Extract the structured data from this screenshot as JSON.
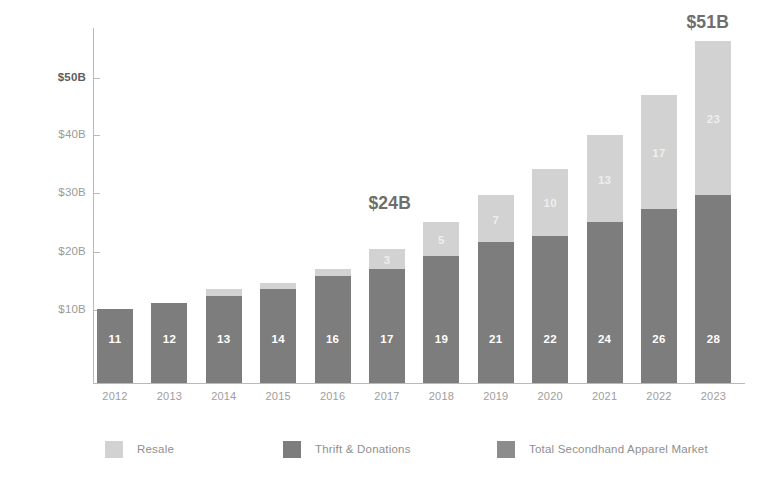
{
  "chart_data": {
    "type": "bar",
    "stacked": true,
    "title": "",
    "subtitle": "",
    "xlabel": "",
    "ylabel": "",
    "grid": false,
    "legend_position": "bottom",
    "categories": [
      "2012",
      "2013",
      "2014",
      "2015",
      "2016",
      "2017",
      "2018",
      "2019",
      "2020",
      "2021",
      "2022",
      "2023"
    ],
    "ylim": [
      0,
      53
    ],
    "yticks": [
      10,
      20,
      30,
      40,
      50
    ],
    "ytick_labels": [
      "$10B",
      "$20B",
      "$30B",
      "$40B",
      "$50B"
    ],
    "series": [
      {
        "name": "Thrift & Donations",
        "color": "#7d7d7d",
        "values": [
          11,
          12,
          13,
          14,
          16,
          17,
          19,
          21,
          22,
          24,
          26,
          28
        ],
        "labels": [
          "11",
          "12",
          "13",
          "14",
          "16",
          "17",
          "19",
          "21",
          "22",
          "24",
          "26",
          "28"
        ]
      },
      {
        "name": "Resale",
        "color": "#d2d2d2",
        "values": [
          0,
          0,
          1,
          1,
          1,
          3,
          5,
          7,
          10,
          13,
          17,
          23
        ],
        "labels": [
          "",
          "",
          "",
          "",
          "",
          "3",
          "5",
          "7",
          "10",
          "13",
          "17",
          "23"
        ]
      }
    ],
    "totals": [
      11,
      12,
      14,
      15,
      17,
      20,
      24,
      28,
      32,
      37,
      43,
      51
    ],
    "annotations": [
      {
        "text": "$24B",
        "category": "2018"
      },
      {
        "text": "$51B",
        "category": "2023"
      }
    ],
    "legend": [
      {
        "label": "Resale",
        "color": "#d2d2d2",
        "swatch": "resale-swatch"
      },
      {
        "label": "Thrift & Donations",
        "color": "#7d7d7d",
        "swatch": "thrift-swatch"
      },
      {
        "label": "Total Secondhand Apparel Market",
        "color": "#8c8c8c",
        "swatch": "total-swatch"
      }
    ]
  },
  "axis": {
    "y_labels": [
      {
        "text": "$50B",
        "emphasis": true
      },
      {
        "text": "$40B",
        "emphasis": false
      },
      {
        "text": "$30B",
        "emphasis": false
      },
      {
        "text": "$20B",
        "emphasis": false
      },
      {
        "text": "$10B",
        "emphasis": false
      }
    ],
    "x_labels": [
      "2012",
      "2013",
      "2014",
      "2015",
      "2016",
      "2017",
      "2018",
      "2019",
      "2020",
      "2021",
      "2022",
      "2023"
    ]
  },
  "colors": {
    "resale": "#d2d2d2",
    "thrift": "#7d7d7d",
    "total": "#8c8c8c",
    "axis": "#b9b9b9",
    "tick_text": "#9a9a9a",
    "callout": "#6e6e6e",
    "background": "#ffffff"
  }
}
